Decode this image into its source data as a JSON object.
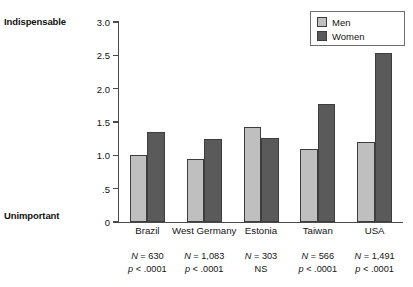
{
  "chart_data": {
    "type": "bar",
    "title": "",
    "subtitle": "",
    "xlabel": "",
    "ylabel": "",
    "ylim": [
      0,
      3.0
    ],
    "yticks": [
      "0",
      ".5",
      "1.0",
      "1.5",
      "2.0",
      "2.5",
      "3.0"
    ],
    "ytick_values": [
      0,
      0.5,
      1.0,
      1.5,
      2.0,
      2.5,
      3.0
    ],
    "axis_anchor_high": "Indispensable",
    "axis_anchor_low": "Unimportant",
    "grid": false,
    "legend_position": "top-right",
    "categories": [
      "Brazil",
      "West Germany",
      "Estonia",
      "Taiwan",
      "USA"
    ],
    "series": [
      {
        "name": "Men",
        "color": "#bfbfbf",
        "values": [
          1.0,
          0.94,
          1.43,
          1.09,
          1.2
        ]
      },
      {
        "name": "Women",
        "color": "#5a5a5a",
        "values": [
          1.35,
          1.25,
          1.26,
          1.77,
          2.53
        ]
      }
    ],
    "annotations": [
      {
        "n": "N = 630",
        "p": "p < .0001"
      },
      {
        "n": "N = 1,083",
        "p": "p < .0001"
      },
      {
        "n": "N = 303",
        "p": "NS"
      },
      {
        "n": "N = 566",
        "p": "p < .0001"
      },
      {
        "n": "N = 1,491",
        "p": "p < .0001"
      }
    ]
  },
  "legend": {
    "items": [
      {
        "label": "Men",
        "swatch": "men"
      },
      {
        "label": "Women",
        "swatch": "women"
      }
    ]
  }
}
